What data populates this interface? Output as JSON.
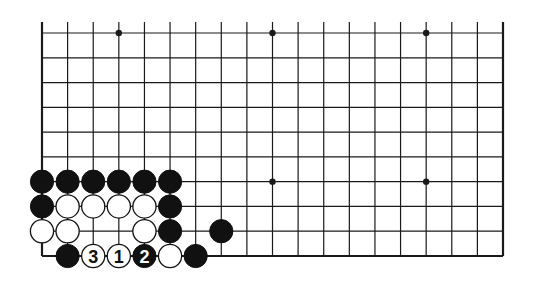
{
  "diagram": {
    "type": "go-board-fragment",
    "columns": 19,
    "rows_shown": 10,
    "edges": [
      "left",
      "right",
      "bottom"
    ],
    "colors": {
      "line": "#1a1a1a",
      "black_stone": "#111111",
      "white_stone": "#ffffff",
      "background": "#ffffff"
    },
    "star_points": [
      {
        "col": 4,
        "row": 10
      },
      {
        "col": 10,
        "row": 10
      },
      {
        "col": 16,
        "row": 10
      },
      {
        "col": 10,
        "row": 4
      },
      {
        "col": 16,
        "row": 4
      }
    ],
    "stones": [
      {
        "col": 1,
        "row": 4,
        "color": "black",
        "label": ""
      },
      {
        "col": 2,
        "row": 4,
        "color": "black",
        "label": ""
      },
      {
        "col": 3,
        "row": 4,
        "color": "black",
        "label": ""
      },
      {
        "col": 4,
        "row": 4,
        "color": "black",
        "label": ""
      },
      {
        "col": 5,
        "row": 4,
        "color": "black",
        "label": ""
      },
      {
        "col": 6,
        "row": 4,
        "color": "black",
        "label": ""
      },
      {
        "col": 1,
        "row": 3,
        "color": "black",
        "label": ""
      },
      {
        "col": 2,
        "row": 3,
        "color": "white",
        "label": ""
      },
      {
        "col": 3,
        "row": 3,
        "color": "white",
        "label": ""
      },
      {
        "col": 4,
        "row": 3,
        "color": "white",
        "label": ""
      },
      {
        "col": 5,
        "row": 3,
        "color": "white",
        "label": ""
      },
      {
        "col": 6,
        "row": 3,
        "color": "black",
        "label": ""
      },
      {
        "col": 1,
        "row": 2,
        "color": "white",
        "label": ""
      },
      {
        "col": 2,
        "row": 2,
        "color": "white",
        "label": ""
      },
      {
        "col": 5,
        "row": 2,
        "color": "white",
        "label": ""
      },
      {
        "col": 6,
        "row": 2,
        "color": "black",
        "label": ""
      },
      {
        "col": 8,
        "row": 2,
        "color": "black",
        "label": ""
      },
      {
        "col": 2,
        "row": 1,
        "color": "black",
        "label": ""
      },
      {
        "col": 3,
        "row": 1,
        "color": "white",
        "label": "3"
      },
      {
        "col": 4,
        "row": 1,
        "color": "white",
        "label": "1"
      },
      {
        "col": 5,
        "row": 1,
        "color": "black",
        "label": "2"
      },
      {
        "col": 6,
        "row": 1,
        "color": "white",
        "label": ""
      },
      {
        "col": 7,
        "row": 1,
        "color": "black",
        "label": ""
      }
    ]
  }
}
